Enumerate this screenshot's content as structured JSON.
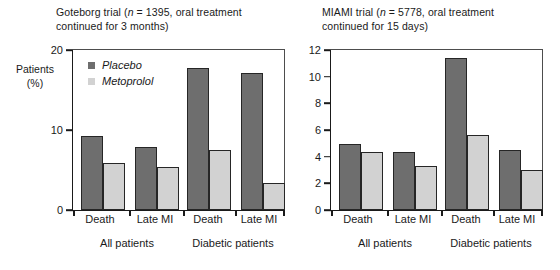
{
  "axis_title": "Patients\n(%)",
  "legend": [
    {
      "label": "Placebo",
      "color": "#6e6e6e"
    },
    {
      "label": "Metoprolol",
      "color": "#d2d2d2"
    }
  ],
  "colors": {
    "placebo": "#6e6e6e",
    "metoprolol": "#d2d2d2",
    "bar_outline": "#262626",
    "axis": "#1a1a1a",
    "background": "#ffffff"
  },
  "chart_data": [
    {
      "type": "bar",
      "id": "goteborg",
      "title": "Goteborg trial (n = 1395, oral treatment continued for 3 months)",
      "title_line1": "Goteborg trial (n = 1395, oral treatment",
      "title_line2": "continued for 3 months)",
      "trial_name": "Goteborg trial",
      "n": 1395,
      "treatment_note": "oral treatment continued for 3 months",
      "xlabel": "",
      "ylabel": "Patients (%)",
      "ylim": [
        0,
        20
      ],
      "yticks": [
        0,
        10,
        20
      ],
      "ytick_labels": [
        "0",
        "10",
        "20"
      ],
      "grid": false,
      "legend_position": "upper-left",
      "categories": [
        "Death",
        "Late MI",
        "Death",
        "Late MI"
      ],
      "groups": [
        {
          "label": "All patients",
          "categories": [
            "Death",
            "Late MI"
          ]
        },
        {
          "label": "Diabetic patients",
          "categories": [
            "Death",
            "Late MI"
          ]
        }
      ],
      "series": [
        {
          "name": "Placebo",
          "values": [
            9.2,
            7.8,
            17.6,
            17.0
          ]
        },
        {
          "name": "Metoprolol",
          "values": [
            5.9,
            5.3,
            7.5,
            3.4
          ]
        }
      ]
    },
    {
      "type": "bar",
      "id": "miami",
      "title": "MIAMI trial (n = 5778, oral treatment continued for 15 days)",
      "title_line1": "MIAMI trial (n = 5778, oral treatment",
      "title_line2": "continued for 15 days)",
      "trial_name": "MIAMI trial",
      "n": 5778,
      "treatment_note": "oral treatment continued for 15 days",
      "xlabel": "",
      "ylabel": "Patients (%)",
      "ylim": [
        0,
        12
      ],
      "yticks": [
        0,
        2,
        4,
        6,
        8,
        10,
        12
      ],
      "ytick_labels": [
        "0",
        "2",
        "4",
        "6",
        "8",
        "10",
        "12"
      ],
      "grid": false,
      "legend_position": "none",
      "categories": [
        "Death",
        "Late MI",
        "Death",
        "Late MI"
      ],
      "groups": [
        {
          "label": "All patients",
          "categories": [
            "Death",
            "Late MI"
          ]
        },
        {
          "label": "Diabetic patients",
          "categories": [
            "Death",
            "Late MI"
          ]
        }
      ],
      "series": [
        {
          "name": "Placebo",
          "values": [
            4.9,
            4.3,
            11.3,
            4.5
          ]
        },
        {
          "name": "Metoprolol",
          "values": [
            4.3,
            3.3,
            5.6,
            3.0
          ]
        }
      ]
    }
  ]
}
